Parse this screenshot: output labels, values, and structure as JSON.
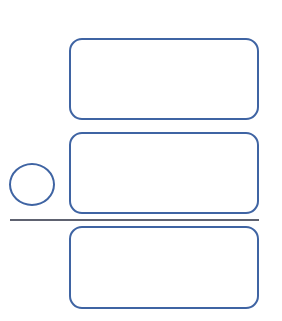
{
  "diagram": {
    "colors": {
      "stroke": "#3f64a3",
      "divider": "#5e6270",
      "background": "#ffffff"
    },
    "boxes": [
      {
        "id": "box-1",
        "label": ""
      },
      {
        "id": "box-2",
        "label": ""
      },
      {
        "id": "box-3",
        "label": ""
      }
    ],
    "circle": {
      "label": ""
    },
    "divider": {
      "label": ""
    }
  }
}
